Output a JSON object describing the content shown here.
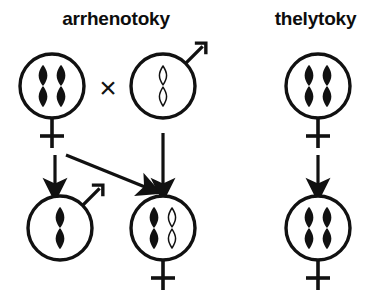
{
  "figure": {
    "width": 387,
    "height": 297,
    "background": "#ffffff",
    "ink_color": "#111111"
  },
  "panels": [
    {
      "id": "arrhenotoky",
      "title": "arrhenotoky",
      "title_x": 116,
      "title_y": 18
    },
    {
      "id": "thelytoky",
      "title": "thelytoky",
      "title_x": 316,
      "title_y": 18
    }
  ],
  "operators": [
    {
      "name": "cross-symbol",
      "glyph": "×",
      "x": 108,
      "y": 87
    }
  ],
  "cells": [
    {
      "id": "arrhenotoky-mother",
      "panel": "arrhenotoky",
      "sex": "female",
      "sex_symbol": "venus",
      "cx": 52,
      "cy": 86,
      "r": 32,
      "ploidy": "diploid",
      "chromosomes": [
        {
          "fill": "solid",
          "offset_x": -9
        },
        {
          "fill": "solid",
          "offset_x": 9
        }
      ]
    },
    {
      "id": "arrhenotoky-father",
      "panel": "arrhenotoky",
      "sex": "male",
      "sex_symbol": "mars",
      "cx": 163,
      "cy": 86,
      "r": 32,
      "ploidy": "haploid",
      "chromosomes": [
        {
          "fill": "outline",
          "offset_x": 0
        }
      ]
    },
    {
      "id": "arrhenotoky-son",
      "panel": "arrhenotoky",
      "sex": "male",
      "sex_symbol": "mars",
      "cx": 60,
      "cy": 228,
      "r": 32,
      "ploidy": "haploid",
      "chromosomes": [
        {
          "fill": "solid",
          "offset_x": 0
        }
      ]
    },
    {
      "id": "arrhenotoky-daughter",
      "panel": "arrhenotoky",
      "sex": "female",
      "sex_symbol": "venus",
      "cx": 163,
      "cy": 228,
      "r": 32,
      "ploidy": "diploid",
      "chromosomes": [
        {
          "fill": "solid",
          "offset_x": -9
        },
        {
          "fill": "outline",
          "offset_x": 9
        }
      ]
    },
    {
      "id": "thelytoky-mother",
      "panel": "thelytoky",
      "sex": "female",
      "sex_symbol": "venus",
      "cx": 318,
      "cy": 86,
      "r": 32,
      "ploidy": "diploid",
      "chromosomes": [
        {
          "fill": "solid",
          "offset_x": -9
        },
        {
          "fill": "solid",
          "offset_x": 9
        }
      ]
    },
    {
      "id": "thelytoky-daughter",
      "panel": "thelytoky",
      "sex": "female",
      "sex_symbol": "venus",
      "cx": 318,
      "cy": 228,
      "r": 32,
      "ploidy": "diploid",
      "chromosomes": [
        {
          "fill": "solid",
          "offset_x": -9
        },
        {
          "fill": "solid",
          "offset_x": 9
        }
      ]
    }
  ],
  "arrows": [
    {
      "id": "arrow-mother-to-son",
      "panel": "arrhenotoky",
      "from": "arrhenotoky-mother",
      "to": "arrhenotoky-son",
      "x1": 55,
      "y1": 155,
      "x2": 55,
      "y2": 190
    },
    {
      "id": "arrow-mother-to-daughter",
      "panel": "arrhenotoky",
      "from": "arrhenotoky-mother",
      "to": "arrhenotoky-daughter",
      "x1": 66,
      "y1": 155,
      "x2": 150,
      "y2": 189
    },
    {
      "id": "arrow-father-to-daughter",
      "panel": "arrhenotoky",
      "from": "arrhenotoky-father",
      "to": "arrhenotoky-daughter",
      "x1": 163,
      "y1": 133,
      "x2": 163,
      "y2": 190
    },
    {
      "id": "arrow-thelytoky-mother-to-daughter",
      "panel": "thelytoky",
      "from": "thelytoky-mother",
      "to": "thelytoky-daughter",
      "x1": 318,
      "y1": 155,
      "x2": 318,
      "y2": 190
    }
  ]
}
